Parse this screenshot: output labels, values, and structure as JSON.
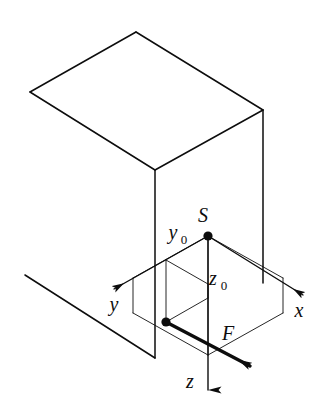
{
  "figure": {
    "type": "technical-line-diagram",
    "background_color": "#ffffff",
    "line_color": "#0d0d0d"
  },
  "labels": {
    "centroid": "S",
    "axis_x": "x",
    "axis_y": "y",
    "axis_z": "z",
    "force": "F",
    "offset_y_base": "y",
    "offset_y_sub": "0",
    "offset_z_base": "z",
    "offset_z_sub": "0"
  },
  "geometry": {
    "block": {
      "front_top": [
        155,
        170
      ],
      "front_bottom": [
        155,
        358
      ],
      "right_top": [
        263,
        110
      ],
      "right_bottom": [
        263,
        283
      ],
      "top_back_left": [
        30,
        92
      ],
      "bottom_back_left": [
        25,
        275
      ],
      "top_back_right": [
        136,
        32
      ],
      "top_rear_apex": [
        136,
        32
      ]
    },
    "origin_S": [
      208,
      236
    ],
    "force_point": [
      166,
      322
    ],
    "axis_x_tip": [
      305,
      297
    ],
    "axis_y_tip": [
      112,
      290
    ],
    "axis_z_tip": [
      208,
      392
    ],
    "force_tip": [
      252,
      367
    ]
  },
  "label_positions": {
    "S": [
      203,
      222
    ],
    "y0": [
      172,
      238
    ],
    "z0": [
      212,
      284
    ],
    "x": [
      298,
      315
    ],
    "y": [
      113,
      310
    ],
    "z": [
      190,
      387
    ],
    "F": [
      226,
      338
    ]
  }
}
